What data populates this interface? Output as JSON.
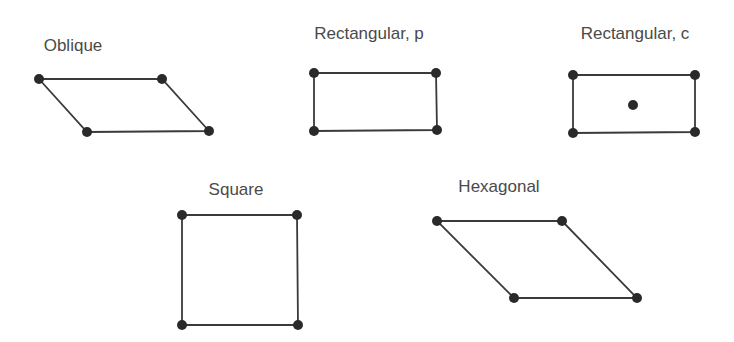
{
  "line_color": "#3a3a3a",
  "point_color": "#2a2a2a",
  "lattices": [
    {
      "name": "Oblique",
      "label_pos": [
        73,
        36
      ],
      "points": [
        [
          39,
          79
        ],
        [
          162,
          79
        ],
        [
          209,
          131
        ],
        [
          87,
          132
        ]
      ],
      "centered": null
    },
    {
      "name": "Rectangular, p",
      "label_pos": [
        369,
        32
      ],
      "points": [
        [
          314,
          73
        ],
        [
          436,
          73
        ],
        [
          437,
          130
        ],
        [
          314,
          131
        ]
      ],
      "centered": null
    },
    {
      "name": "Rectangular, c",
      "label_pos": [
        635,
        34
      ],
      "points": [
        [
          573,
          75
        ],
        [
          695,
          75
        ],
        [
          695,
          132
        ],
        [
          573,
          133
        ]
      ],
      "centered": [
        633,
        105
      ]
    },
    {
      "name": "Square",
      "label_pos": [
        236,
        190
      ],
      "points": [
        [
          182,
          215
        ],
        [
          297,
          215
        ],
        [
          298,
          325
        ],
        [
          182,
          325
        ]
      ],
      "centered": null
    },
    {
      "name": "Hexagonal",
      "label_pos": [
        499,
        186
      ],
      "points": [
        [
          437,
          221
        ],
        [
          562,
          221
        ],
        [
          637,
          298
        ],
        [
          514,
          298
        ]
      ],
      "centered": null
    }
  ]
}
